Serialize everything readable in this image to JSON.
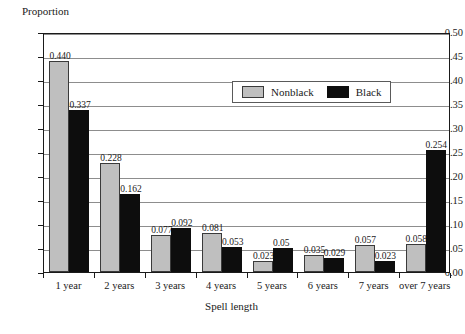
{
  "chart_data": {
    "type": "bar",
    "title": "",
    "xlabel": "Spell length",
    "ylabel": "Proportion",
    "ylim": [
      0.0,
      0.5
    ],
    "ytick_step": 0.05,
    "grid": true,
    "legend_position": "inside-top-center",
    "categories": [
      "1 year",
      "2 years",
      "3 years",
      "4 years",
      "5 years",
      "6 years",
      "7 years",
      "over 7 years"
    ],
    "series": [
      {
        "name": "Nonblack",
        "color": "#bfbfbf",
        "values": [
          0.44,
          0.228,
          0.077,
          0.081,
          0.023,
          0.035,
          0.057,
          0.058
        ],
        "labels": [
          "0.440",
          "0.228",
          "0.077",
          "0.081",
          "0.023",
          "0.035",
          "0.057",
          "0.058"
        ]
      },
      {
        "name": "Black",
        "color": "#0d0d0d",
        "values": [
          0.337,
          0.162,
          0.092,
          0.053,
          0.05,
          0.029,
          0.023,
          0.254
        ],
        "labels": [
          "0.337",
          "0.162",
          "0.092",
          "0.053",
          "0.05",
          "0.029",
          "0.023",
          "0.254"
        ]
      }
    ],
    "ytick_labels": [
      "0.00",
      "0.05",
      "0.10",
      "0.15",
      "0.20",
      "0.25",
      "0.30",
      "0.35",
      "0.40",
      "0.45",
      "0.50"
    ]
  },
  "legend": {
    "entries": [
      {
        "label": "Nonblack",
        "swatch": "nonblack"
      },
      {
        "label": "Black",
        "swatch": "black"
      }
    ]
  },
  "axes": {
    "y_title": "Proportion",
    "x_title": "Spell length"
  }
}
